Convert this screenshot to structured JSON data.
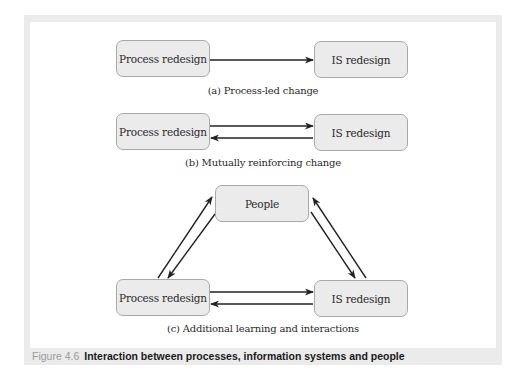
{
  "figure": {
    "number": "Figure 4.6",
    "title": "Interaction between processes, information systems and people"
  },
  "panels": {
    "a": {
      "caption": "(a) Process-led change",
      "left_box": "Process redesign",
      "right_box": "IS redesign",
      "arrows": [
        {
          "from": "Process redesign",
          "to": "IS redesign"
        }
      ]
    },
    "b": {
      "caption": "(b) Mutually reinforcing change",
      "left_box": "Process redesign",
      "right_box": "IS redesign",
      "arrows": [
        {
          "from": "Process redesign",
          "to": "IS redesign"
        },
        {
          "from": "IS redesign",
          "to": "Process redesign"
        }
      ]
    },
    "c": {
      "caption": "(c) Additional learning and interactions",
      "top_box": "People",
      "left_box": "Process redesign",
      "right_box": "IS redesign",
      "arrows": [
        {
          "from": "Process redesign",
          "to": "IS redesign"
        },
        {
          "from": "IS redesign",
          "to": "Process redesign"
        },
        {
          "from": "Process redesign",
          "to": "People"
        },
        {
          "from": "People",
          "to": "Process redesign"
        },
        {
          "from": "IS redesign",
          "to": "People"
        },
        {
          "from": "People",
          "to": "IS redesign"
        }
      ]
    }
  },
  "colors": {
    "frame": "#ebebeb",
    "box_fill": "#ebebeb",
    "box_border": "#a9a9a9",
    "arrow": "#222222",
    "figure_number": "#9a9a9a"
  }
}
